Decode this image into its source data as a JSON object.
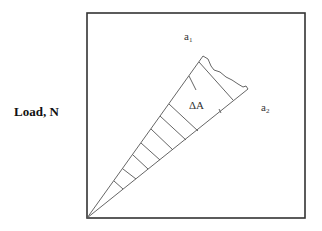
{
  "diagram": {
    "y_axis_label": "Load, N",
    "labels": {
      "a1": {
        "base": "a",
        "sub": "1"
      },
      "a2": {
        "base": "a",
        "sub": "2"
      },
      "delta_area": "ΔA"
    },
    "colors": {
      "frame": "#333333",
      "lines": "#555555",
      "background": "#ffffff"
    }
  }
}
